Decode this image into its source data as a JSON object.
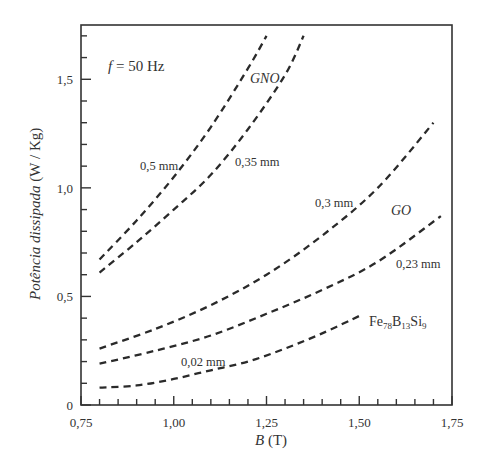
{
  "chart_data": {
    "type": "line",
    "title": "",
    "xlabel": "B (T)",
    "ylabel": "Potência dissipada (W / Kg)",
    "xlim": [
      0.75,
      1.75
    ],
    "ylim": [
      0,
      1.75
    ],
    "xticks": [
      "0,75",
      "1,00",
      "1,25",
      "1,50",
      "1,75"
    ],
    "yticks": [
      "0",
      "0,5",
      "1,0",
      "1,5"
    ],
    "grid": false,
    "legend": "none (inline curve annotations)",
    "annotations": {
      "frequency": "f = 50 Hz",
      "group_gno": "GNO",
      "group_go": "GO"
    },
    "series": [
      {
        "name": "0,5 mm",
        "group": "GNO",
        "style": "dashed",
        "x": [
          0.8,
          0.9,
          1.0,
          1.1,
          1.2,
          1.25
        ],
        "y": [
          0.67,
          0.85,
          1.05,
          1.28,
          1.55,
          1.7
        ]
      },
      {
        "name": "0,35 mm",
        "group": "GNO",
        "style": "dashed",
        "x": [
          0.8,
          0.9,
          1.0,
          1.1,
          1.2,
          1.3,
          1.35
        ],
        "y": [
          0.61,
          0.75,
          0.9,
          1.06,
          1.27,
          1.52,
          1.7
        ]
      },
      {
        "name": "0,3 mm",
        "group": "GO",
        "style": "dashed",
        "x": [
          0.8,
          0.95,
          1.1,
          1.25,
          1.4,
          1.55,
          1.7
        ],
        "y": [
          0.26,
          0.35,
          0.46,
          0.6,
          0.78,
          1.0,
          1.3
        ]
      },
      {
        "name": "0,23 mm",
        "group": "GO",
        "style": "dashed",
        "x": [
          0.8,
          0.95,
          1.1,
          1.25,
          1.4,
          1.55,
          1.72
        ],
        "y": [
          0.19,
          0.25,
          0.32,
          0.42,
          0.53,
          0.66,
          0.87
        ]
      },
      {
        "name": "0,02 mm (Fe78B13Si9)",
        "group": "Fe78B13Si9",
        "style": "dashed",
        "x": [
          0.8,
          0.9,
          1.0,
          1.1,
          1.2,
          1.3,
          1.4,
          1.5
        ],
        "y": [
          0.08,
          0.09,
          0.12,
          0.16,
          0.2,
          0.26,
          0.33,
          0.41
        ]
      }
    ]
  },
  "labels": {
    "freq_f": "f",
    "freq_rest": " = 50 Hz",
    "gno": "GNO",
    "go": "GO",
    "s05": "0,5 mm",
    "s035": "0,35 mm",
    "s03": "0,3 mm",
    "s023": "0,23 mm",
    "s002": "0,02 mm",
    "alloy_fe": "Fe",
    "alloy_78": "78",
    "alloy_b": "B",
    "alloy_13": "13",
    "alloy_si": "Si",
    "alloy_9": "9",
    "x_title_var": "B",
    "x_title_unit": " (T)",
    "y_title_it": "Potência dissipada",
    "y_title_unit": " (W / Kg)"
  }
}
